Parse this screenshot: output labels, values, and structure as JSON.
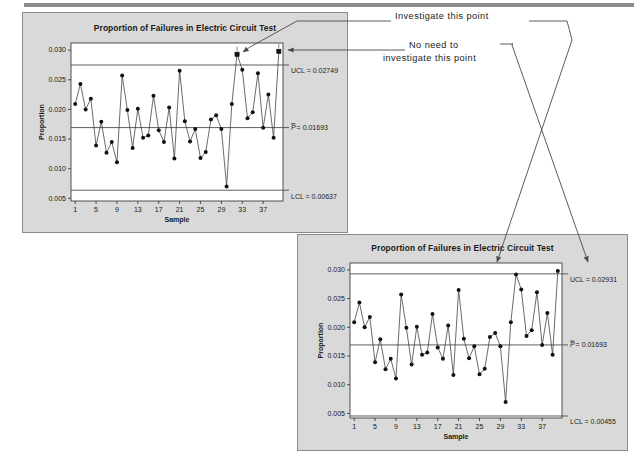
{
  "page": {
    "background": "#ffffff",
    "panel_background": "#d9d9d9",
    "line_color": "#3a3a3a",
    "marker_color": "#111111"
  },
  "annotations": [
    {
      "id": "investigate",
      "text": "Investigate this point"
    },
    {
      "id": "noneed_line1",
      "text": "No need to"
    },
    {
      "id": "noneed_line2",
      "text": "investigate this point"
    }
  ],
  "chart_data": [
    {
      "id": "chart-1",
      "type": "line",
      "title": "Proportion of Failures in Electric Circuit Test",
      "xlabel": "Sample",
      "ylabel": "Proportion",
      "grid": false,
      "legend": "none",
      "xlim": [
        0.2,
        40.8
      ],
      "ylim": [
        0.00455,
        0.0312
      ],
      "xticks": [
        1,
        5,
        9,
        13,
        17,
        21,
        25,
        29,
        33,
        37
      ],
      "yticks": [
        0.005,
        0.01,
        0.015,
        0.02,
        0.025,
        0.03
      ],
      "ytick_labels": [
        "0.005",
        "0.010",
        "0.015",
        "0.020",
        "0.025",
        "0.030"
      ],
      "control_limits": {
        "ucl": {
          "value": 0.02749,
          "label": "UCL = 0.02749"
        },
        "center": {
          "value": 0.01693,
          "label": "P = 0.01693",
          "label_prefix": "P̄ =",
          "label_value": "0.01693"
        },
        "lcl": {
          "value": 0.00637,
          "label": "LCL = 0.00637"
        }
      },
      "x": [
        1,
        2,
        3,
        4,
        5,
        6,
        7,
        8,
        9,
        10,
        11,
        12,
        13,
        14,
        15,
        16,
        17,
        18,
        19,
        20,
        21,
        22,
        23,
        24,
        25,
        26,
        27,
        28,
        29,
        30,
        31,
        32,
        33,
        34,
        35,
        36,
        37,
        38,
        39,
        40
      ],
      "values": [
        0.0209,
        0.0243,
        0.02,
        0.0218,
        0.0139,
        0.0179,
        0.0127,
        0.0145,
        0.0111,
        0.0257,
        0.0199,
        0.0135,
        0.0201,
        0.0152,
        0.0156,
        0.0223,
        0.0165,
        0.0145,
        0.0203,
        0.0117,
        0.0265,
        0.018,
        0.0146,
        0.0167,
        0.0118,
        0.0128,
        0.0183,
        0.019,
        0.0167,
        0.007,
        0.0209,
        0.0293,
        0.0267,
        0.0185,
        0.0195,
        0.0261,
        0.0169,
        0.0225,
        0.0152,
        0.0298
      ],
      "out_of_control_points": [
        32,
        40
      ]
    },
    {
      "id": "chart-2",
      "type": "line",
      "title": "Proportion of Failures in Electric Circuit Test",
      "xlabel": "Sample",
      "ylabel": "Proportion",
      "grid": false,
      "legend": "none",
      "xlim": [
        0.2,
        40.8
      ],
      "ylim": [
        0.0042,
        0.0312
      ],
      "xticks": [
        1,
        5,
        9,
        13,
        17,
        21,
        25,
        29,
        33,
        37
      ],
      "yticks": [
        0.005,
        0.01,
        0.015,
        0.02,
        0.025,
        0.03
      ],
      "ytick_labels": [
        "0.005",
        "0.010",
        "0.015",
        "0.020",
        "0.025",
        "0.030"
      ],
      "control_limits": {
        "ucl": {
          "value": 0.02931,
          "label": "UCL = 0.02931"
        },
        "center": {
          "value": 0.01693,
          "label": "P = 0.01693",
          "label_prefix": "P̄ =",
          "label_value": "0.01693"
        },
        "lcl": {
          "value": 0.00455,
          "label": "LCL = 0.00455"
        }
      },
      "x": [
        1,
        2,
        3,
        4,
        5,
        6,
        7,
        8,
        9,
        10,
        11,
        12,
        13,
        14,
        15,
        16,
        17,
        18,
        19,
        20,
        21,
        22,
        23,
        24,
        25,
        26,
        27,
        28,
        29,
        30,
        31,
        32,
        33,
        34,
        35,
        36,
        37,
        38,
        39,
        40
      ],
      "values": [
        0.0209,
        0.0243,
        0.02,
        0.0218,
        0.0139,
        0.0179,
        0.0127,
        0.0145,
        0.0111,
        0.0257,
        0.0199,
        0.0135,
        0.0201,
        0.0152,
        0.0156,
        0.0223,
        0.0165,
        0.0145,
        0.0203,
        0.0117,
        0.0265,
        0.018,
        0.0146,
        0.0167,
        0.0118,
        0.0128,
        0.0183,
        0.019,
        0.0167,
        0.007,
        0.0209,
        0.0292,
        0.0266,
        0.0185,
        0.0195,
        0.0261,
        0.0169,
        0.0225,
        0.0152,
        0.0298
      ],
      "out_of_control_points": []
    }
  ]
}
